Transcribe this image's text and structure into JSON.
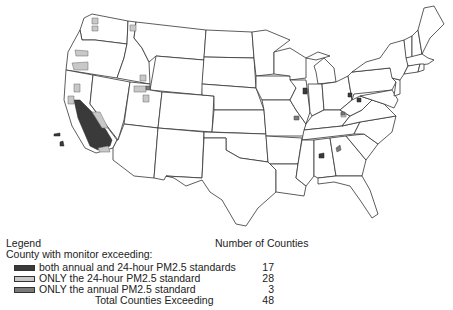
{
  "legend": {
    "title": "Legend",
    "subtitle": "County with monitor exceeding:",
    "count_header": "Number of Counties",
    "items": [
      {
        "label": "both annual and 24-hour PM2.5 standards",
        "count": "17",
        "color": "#3a3a3a"
      },
      {
        "label": "ONLY the 24-hour PM2.5 standard",
        "count": "28",
        "color": "#c8c8c8"
      },
      {
        "label": "ONLY the annual PM2.5 standard",
        "count": "3",
        "color": "#7a7a7a"
      }
    ],
    "total": {
      "label": "Total Counties Exceeding",
      "count": "48"
    }
  },
  "map": {
    "region": "Contiguous United States",
    "background": "#ffffff",
    "state_border_color": "#333333"
  }
}
